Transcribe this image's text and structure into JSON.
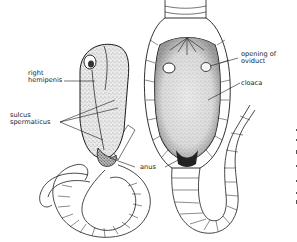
{
  "figure": {
    "left_specimen": "male cloaca with everted hemipenis (lateral view)",
    "right_specimen": "female cloaca opened (ventral view)"
  },
  "labels": {
    "right_hemipenis_line1": "right",
    "right_hemipenis_line2": "hemipenis",
    "sulcus_line1": "sulcus",
    "sulcus_line2": "spermaticus",
    "anus": "anus",
    "oviduct_line1": "opening of",
    "oviduct_line2": "oviduct",
    "cloaca": "cloaca"
  },
  "colors": {
    "ink": "#1a1a1a",
    "stipple": "#8a8a8a",
    "background": "#ffffff"
  }
}
